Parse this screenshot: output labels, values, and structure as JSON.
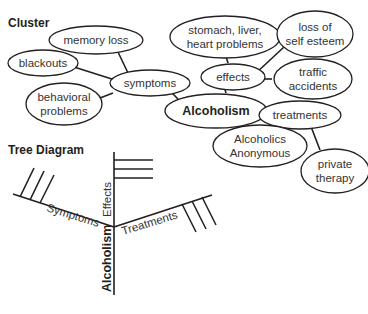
{
  "cluster": {
    "heading": "Cluster",
    "center": "Alcoholism",
    "nodes": {
      "symptoms": "symptoms",
      "memory_loss": "memory loss",
      "blackouts": "blackouts",
      "behavioral_1": "behavioral",
      "behavioral_2": "problems",
      "effects": "effects",
      "stomach_1": "stomach, liver,",
      "stomach_2": "heart problems",
      "esteem_1": "loss of",
      "esteem_2": "self esteem",
      "traffic_1": "traffic",
      "traffic_2": "accidents",
      "treatments": "treatments",
      "aa_1": "Alcoholics",
      "aa_2": "Anonymous",
      "therapy_1": "private",
      "therapy_2": "therapy"
    }
  },
  "tree": {
    "heading": "Tree Diagram",
    "trunk": "Alcoholism",
    "branches": {
      "symptoms": "Symptoms",
      "effects": "Effects",
      "treatments": "Treatments"
    }
  },
  "colors": {
    "line": "#231f20",
    "text": "#333333",
    "background": "#ffffff"
  }
}
